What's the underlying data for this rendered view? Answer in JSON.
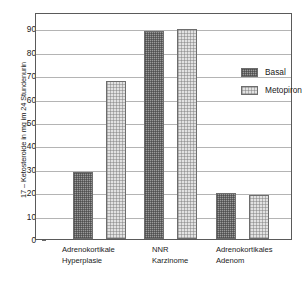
{
  "chart_data": {
    "type": "bar",
    "title": "",
    "xlabel": "",
    "ylabel": "17 – Ketosteroide in mg im 24 Stundenurin",
    "ylim": [
      0,
      97
    ],
    "yticks": [
      0,
      10,
      20,
      30,
      40,
      50,
      60,
      70,
      80,
      90
    ],
    "ytick_labels": [
      "0",
      "10",
      "20",
      "30",
      "40",
      "50",
      "60",
      "70",
      "80",
      "90"
    ],
    "grid": "horizontal",
    "legend_position": "inside-upper-right",
    "categories": [
      "Adrenokortikale Hyperplasie",
      "NNR Karzinome",
      "Adrenokortikales Adenom"
    ],
    "category_lines": [
      [
        "Adrenokortikale",
        "Hyperplasie"
      ],
      [
        "NNR",
        "Karzinome"
      ],
      [
        "Adrenokortikales",
        "Adenom"
      ]
    ],
    "series": [
      {
        "name": "Basal",
        "values": [
          28.5,
          89.0,
          19.8
        ],
        "color": "#9a9a9a",
        "pattern": "dark-checker"
      },
      {
        "name": "Metopiron",
        "values": [
          67.5,
          89.6,
          19.0
        ],
        "color": "#e2e2e2",
        "pattern": "light-speckle"
      }
    ]
  },
  "legend": {
    "entries": [
      {
        "label": "Basal"
      },
      {
        "label": "Metopiron"
      }
    ]
  },
  "axis": {
    "y_title": "17 – Ketosteroide in mg im 24 Stundenurin"
  },
  "colors": {
    "frame": "#5a5a5a",
    "gridline": "#b4b4b4",
    "basal_fill": "#9a9a9a",
    "metopiron_fill": "#e2e2e2",
    "bar_border": "#6d6d6d",
    "text": "#1a1a1a",
    "background": "#ffffff"
  }
}
